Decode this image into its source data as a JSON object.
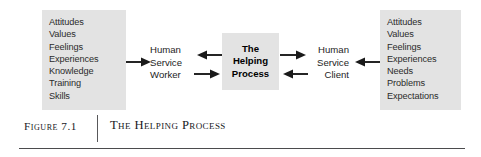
{
  "figure": {
    "number_label": "Figure 7.1",
    "title": "The Helping Process"
  },
  "diagram": {
    "left_panel": {
      "name": "human-service-worker-attributes",
      "items": [
        "Attitudes",
        "Values",
        "Feelings",
        "Experiences",
        "Knowledge",
        "Training",
        "Skills"
      ]
    },
    "right_panel": {
      "name": "human-service-client-attributes",
      "items": [
        "Attitudes",
        "Values",
        "Feelings",
        "Experiences",
        "Needs",
        "Problems",
        "Expectations"
      ]
    },
    "worker_label": {
      "line1": "Human",
      "line2": "Service",
      "line3": "Worker"
    },
    "client_label": {
      "line1": "Human",
      "line2": "Service",
      "line3": "Client"
    },
    "process_box": {
      "line1": "The",
      "line2": "Helping",
      "line3": "Process"
    },
    "arrows": [
      {
        "name": "arrow-left-panel-to-worker",
        "direction": "right"
      },
      {
        "name": "arrow-process-to-worker",
        "direction": "left"
      },
      {
        "name": "arrow-worker-to-process",
        "direction": "right"
      },
      {
        "name": "arrow-process-to-client",
        "direction": "right"
      },
      {
        "name": "arrow-client-to-process",
        "direction": "left"
      },
      {
        "name": "arrow-right-panel-to-client",
        "direction": "left"
      }
    ]
  },
  "colors": {
    "panel_fill": "#e3e3e3",
    "arrow_stroke": "#1a1a1a",
    "text": "#2b2b2b",
    "rule": "#4b4b4d"
  }
}
